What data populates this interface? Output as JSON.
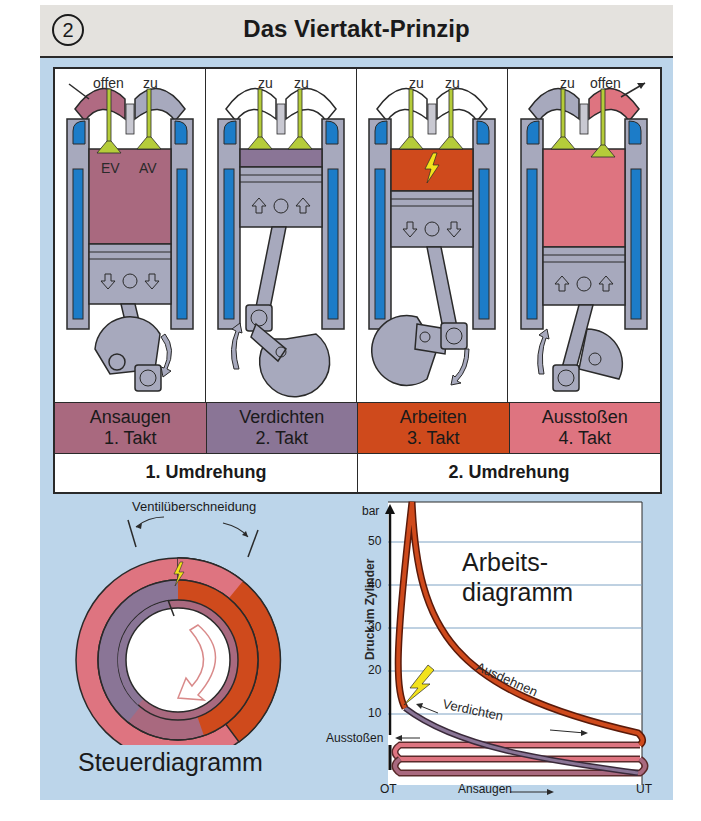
{
  "header": {
    "number": "2",
    "title": "Das Viertakt-Prinzip"
  },
  "strokes": [
    {
      "valve_left": "offen",
      "valve_right": "zu",
      "ev_label": "EV",
      "av_label": "AV",
      "name": "Ansaugen",
      "takt": "1. Takt",
      "color": "#a9697f"
    },
    {
      "valve_left": "zu",
      "valve_right": "zu",
      "name": "Verdichten",
      "takt": "2. Takt",
      "color": "#8a7596"
    },
    {
      "valve_left": "zu",
      "valve_right": "zu",
      "name": "Arbeiten",
      "takt": "3. Takt",
      "color": "#cf4a1c"
    },
    {
      "valve_left": "zu",
      "valve_right": "offen",
      "name": "Ausstoßen",
      "takt": "4. Takt",
      "color": "#de7480"
    }
  ],
  "revolutions": [
    "1. Umdrehung",
    "2. Umdrehung"
  ],
  "steuerdiagramm": {
    "title": "Steuerdiagramm",
    "overlap_label": "Ventilüberschneidung"
  },
  "arbeitsdiagramm": {
    "title_line1": "Arbeits-",
    "title_line2": "diagramm",
    "ylabel": "Druck im Zylinder",
    "yunit": "bar",
    "yticks": [
      "10",
      "20",
      "30",
      "40",
      "50"
    ],
    "x_left": "OT",
    "x_right": "UT",
    "phase_labels": {
      "ausdehnen": "Ausdehnen",
      "verdichten": "Verdichten",
      "ausstossen": "Ausstoßen",
      "ansaugen": "Ansaugen"
    }
  },
  "colors": {
    "background": "#bcd5ea",
    "header": "#e4e2de",
    "valve": "#b5cc3a",
    "coolant": "#1c7cc8",
    "metal": "#a7a9bd",
    "spark": "#f2e21c"
  }
}
